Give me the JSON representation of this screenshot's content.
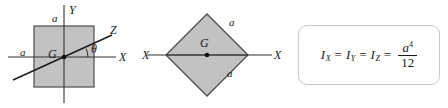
{
  "figure": {
    "width": 448,
    "height": 108,
    "background": "#ffffff",
    "fill_color": "#c0c0c0",
    "stroke_color": "#4d4d4d",
    "line_color": "#333333"
  },
  "panel_square": {
    "name": "square-cross-section",
    "shape": "square",
    "side_label_top": "a",
    "side_label_left": "a",
    "centroid_label": "G",
    "axis_x_label": "X",
    "axis_y_label": "Y",
    "axis_z_label": "Z",
    "angle_label": "θ"
  },
  "panel_diamond": {
    "name": "rotated-square-cross-section",
    "shape": "square rotated 45 degrees",
    "side_label_upper": "a",
    "side_label_lower": "a",
    "centroid_label": "G",
    "axis_x_label_left": "X",
    "axis_x_label_right": "X"
  },
  "panel_formula": {
    "name": "moment-of-inertia-formula",
    "i_x": "I",
    "i_x_sub": "X",
    "i_y": "I",
    "i_y_sub": "Y",
    "i_z": "I",
    "i_z_sub": "Z",
    "equals": "=",
    "numerator": "a",
    "numerator_exponent": "4",
    "denominator": "12",
    "plain_text": "I_X = I_Y = I_Z = a^4 / 12"
  }
}
